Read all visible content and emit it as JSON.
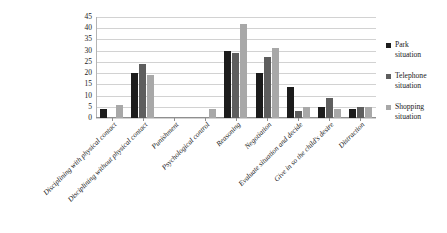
{
  "chart_data": {
    "type": "bar",
    "title": "",
    "subtitle": "",
    "xlabel": "",
    "ylabel": "",
    "ylim": [
      0,
      45
    ],
    "yticks": [
      0,
      5,
      10,
      15,
      20,
      25,
      30,
      35,
      40,
      45
    ],
    "grid": true,
    "legend_position": "right",
    "categories": [
      "Disciplining with physical contact",
      "Disciplining without physical contact",
      "Punishment",
      "Psychological control",
      "Reasoning",
      "Negotiation",
      "Evaluate situation and decide",
      "Give in so the child's desire",
      "Distraction"
    ],
    "series": [
      {
        "name": "Park situation",
        "color": "#1c1c1c",
        "values": [
          4,
          20,
          0,
          0,
          30,
          20,
          14,
          5,
          4
        ]
      },
      {
        "name": "Telephone situation",
        "color": "#5e5e5e",
        "values": [
          0,
          24,
          0,
          0,
          29,
          27,
          3,
          9,
          5
        ]
      },
      {
        "name": "Shopping situation",
        "color": "#a8a8a8",
        "values": [
          6,
          19,
          0,
          4,
          42,
          31,
          5,
          4,
          5
        ]
      }
    ]
  },
  "legend": {
    "items": [
      {
        "label_line1": "Park",
        "label_line2": "situation"
      },
      {
        "label_line1": "Telephone",
        "label_line2": "situation"
      },
      {
        "label_line1": "Shopping",
        "label_line2": "situation"
      }
    ]
  }
}
